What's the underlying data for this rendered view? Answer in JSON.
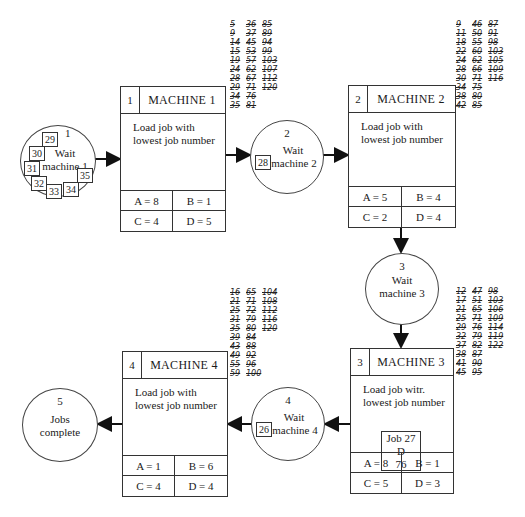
{
  "machines": [
    {
      "num": "1",
      "title": "MACHINE 1",
      "desc1": "Load job with",
      "desc2": "lowest job number",
      "A": "A = 8",
      "B": "B = 1",
      "C": "C = 4",
      "D": "D = 5"
    },
    {
      "num": "2",
      "title": "MACHINE 2",
      "desc1": "Load job with",
      "desc2": "lowest job number",
      "A": "A = 5",
      "B": "B = 4",
      "C": "C = 2",
      "D": "D = 4"
    },
    {
      "num": "3",
      "title": "MACHINE 3",
      "desc1": "Load job witr.",
      "desc2": "lowest job number",
      "A": "A = 8",
      "B": "B = 1",
      "C": "C = 5",
      "D": "D = 3",
      "job_card": {
        "line1": "Job 27",
        "line2": "D",
        "line3": "76"
      }
    },
    {
      "num": "4",
      "title": "MACHINE 4",
      "desc1": "Load job with",
      "desc2": "lowest job number",
      "A": "A = 1",
      "B": "B = 6",
      "C": "C = 4",
      "D": "D = 4"
    }
  ],
  "waits": [
    {
      "num": "1",
      "line1": "Wait",
      "line2": "machine 1",
      "jobs": [
        "29",
        "30",
        "31",
        "32",
        "33",
        "34",
        "35"
      ]
    },
    {
      "num": "2",
      "line1": "Wait",
      "line2": "machine 2",
      "jobs": [
        "28"
      ]
    },
    {
      "num": "3",
      "line1": "Wait",
      "line2": "machine 3",
      "jobs": []
    },
    {
      "num": "4",
      "line1": "Wait",
      "line2": "machine 4",
      "jobs": [
        "26"
      ]
    },
    {
      "num": "5",
      "line1": "Jobs",
      "line2": "complete",
      "jobs": []
    }
  ],
  "tallies": {
    "machine1": [
      [
        "5",
        "36",
        "85"
      ],
      [
        "9",
        "37",
        "89"
      ],
      [
        "14",
        "45",
        "94"
      ],
      [
        "15",
        "53",
        "99"
      ],
      [
        "19",
        "57",
        "103"
      ],
      [
        "24",
        "62",
        "107"
      ],
      [
        "28",
        "67",
        "112"
      ],
      [
        "29",
        "71",
        "120"
      ],
      [
        "34",
        "76",
        ""
      ],
      [
        "35",
        "81",
        ""
      ]
    ],
    "machine2": [
      [
        "9",
        "46",
        "87"
      ],
      [
        "11",
        "50",
        "91"
      ],
      [
        "18",
        "55",
        "98"
      ],
      [
        "22",
        "60",
        "103"
      ],
      [
        "24",
        "62",
        "105"
      ],
      [
        "28",
        "66",
        "109"
      ],
      [
        "30",
        "71",
        "116"
      ],
      [
        "34",
        "75",
        ""
      ],
      [
        "38",
        "80",
        ""
      ],
      [
        "42",
        "85",
        ""
      ]
    ],
    "machine3": [
      [
        "12",
        "47",
        "98"
      ],
      [
        "17",
        "51",
        "103"
      ],
      [
        "21",
        "65",
        "106"
      ],
      [
        "25",
        "71",
        "109"
      ],
      [
        "29",
        "76",
        "114"
      ],
      [
        "32",
        "79",
        "119"
      ],
      [
        "37",
        "82",
        "122"
      ],
      [
        "38",
        "87",
        ""
      ],
      [
        "41",
        "90",
        ""
      ],
      [
        "45",
        "95",
        ""
      ]
    ],
    "machine4": [
      [
        "16",
        "65",
        "104"
      ],
      [
        "21",
        "71",
        "108"
      ],
      [
        "25",
        "72",
        "112"
      ],
      [
        "31",
        "79",
        "116"
      ],
      [
        "35",
        "80",
        "120"
      ],
      [
        "39",
        "84",
        ""
      ],
      [
        "43",
        "88",
        ""
      ],
      [
        "49",
        "92",
        ""
      ],
      [
        "55",
        "96",
        ""
      ],
      [
        "59",
        "100",
        ""
      ]
    ]
  }
}
